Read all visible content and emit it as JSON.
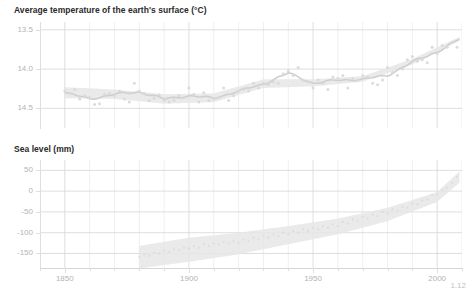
{
  "corner": {
    "mark": "·"
  },
  "footnote": {
    "text": "1.12"
  },
  "panels": {
    "temperature": {
      "title": "Average temperature of the earth's surface (°C)",
      "y_ticks": [
        "14.5",
        "14.0",
        "13.5"
      ]
    },
    "sealevel": {
      "title": "Sea level (mm)",
      "y_ticks": [
        "50",
        "0",
        "-50",
        "-100",
        "-150"
      ]
    }
  },
  "x_axis": {
    "labels": [
      "1850",
      "1900",
      "1950",
      "2000"
    ],
    "range": [
      1840,
      2010
    ],
    "major_step": 50,
    "minor_step": 10
  },
  "style": {
    "point_color": "#d9d9d9",
    "line_color": "#cfcfcf",
    "band_color": "#e6e6e6",
    "grid_color": "#e4e4e4",
    "axis_text_color": "#b4b4b4",
    "title_color": "#2a2a2a",
    "background": "#ffffff"
  },
  "chart_data": [
    {
      "type": "scatter",
      "id": "temperature",
      "title": "Average temperature of the earth's surface (°C)",
      "xlabel": "",
      "ylabel": "Average temperature of the earth's surface (°C)",
      "xlim": [
        1840,
        2010
      ],
      "ylim": [
        13.25,
        14.6
      ],
      "yticks": [
        13.5,
        14.0,
        14.5
      ],
      "xticks": [
        1850,
        1900,
        1950,
        2000
      ],
      "grid": true,
      "legend": "none",
      "series": [
        {
          "name": "Annual mean temperature (observations)",
          "kind": "scatter",
          "x": [
            1850,
            1852,
            1854,
            1856,
            1858,
            1860,
            1862,
            1864,
            1866,
            1868,
            1870,
            1872,
            1874,
            1876,
            1878,
            1880,
            1882,
            1884,
            1886,
            1888,
            1890,
            1892,
            1894,
            1896,
            1898,
            1900,
            1902,
            1904,
            1906,
            1908,
            1910,
            1912,
            1914,
            1916,
            1918,
            1920,
            1922,
            1924,
            1926,
            1928,
            1930,
            1932,
            1934,
            1936,
            1938,
            1940,
            1942,
            1944,
            1946,
            1948,
            1950,
            1952,
            1954,
            1956,
            1958,
            1960,
            1962,
            1964,
            1966,
            1968,
            1970,
            1972,
            1974,
            1976,
            1978,
            1980,
            1982,
            1984,
            1986,
            1988,
            1990,
            1992,
            1994,
            1996,
            1998,
            2000,
            2002,
            2004,
            2006,
            2008
          ],
          "y": [
            13.72,
            13.69,
            13.74,
            13.62,
            13.66,
            13.64,
            13.55,
            13.56,
            13.68,
            13.69,
            13.66,
            13.72,
            13.62,
            13.58,
            13.82,
            13.72,
            13.69,
            13.6,
            13.63,
            13.67,
            13.6,
            13.58,
            13.6,
            13.66,
            13.64,
            13.76,
            13.68,
            13.58,
            13.7,
            13.6,
            13.62,
            13.64,
            13.76,
            13.6,
            13.66,
            13.72,
            13.74,
            13.72,
            13.82,
            13.76,
            13.82,
            13.8,
            13.84,
            13.82,
            13.94,
            13.98,
            13.92,
            14.02,
            13.86,
            13.84,
            13.76,
            13.86,
            13.82,
            13.74,
            13.9,
            13.88,
            13.92,
            13.76,
            13.88,
            13.86,
            13.92,
            13.9,
            13.82,
            13.8,
            13.86,
            14.02,
            13.96,
            13.92,
            14.0,
            14.12,
            14.16,
            14.1,
            14.12,
            14.08,
            14.28,
            14.2,
            14.3,
            14.28,
            14.34,
            14.28
          ]
        },
        {
          "name": "Smoothed trend",
          "kind": "line",
          "x": [
            1850,
            1860,
            1870,
            1880,
            1890,
            1900,
            1910,
            1920,
            1930,
            1940,
            1950,
            1960,
            1970,
            1980,
            1990,
            2000,
            2009
          ],
          "y": [
            13.7,
            13.62,
            13.68,
            13.71,
            13.62,
            13.66,
            13.63,
            13.72,
            13.81,
            13.95,
            13.82,
            13.86,
            13.87,
            13.92,
            14.09,
            14.22,
            14.38
          ]
        },
        {
          "name": "Uncertainty band",
          "kind": "band",
          "x": [
            1850,
            1870,
            1890,
            1910,
            1930,
            1950,
            1970,
            1990,
            2009
          ],
          "y_low": [
            13.63,
            13.62,
            13.56,
            13.58,
            13.76,
            13.78,
            13.84,
            14.06,
            14.36
          ],
          "y_high": [
            13.77,
            13.74,
            13.68,
            13.69,
            13.87,
            13.87,
            13.91,
            14.13,
            14.41
          ]
        }
      ]
    },
    {
      "type": "scatter",
      "id": "sealevel",
      "title": "Sea level (mm)",
      "xlabel": "",
      "ylabel": "Sea level (mm)",
      "xlim": [
        1840,
        2010
      ],
      "ylim": [
        -185,
        75
      ],
      "yticks": [
        50,
        0,
        -50,
        -100,
        -150
      ],
      "xticks": [
        1850,
        1900,
        1950,
        2000
      ],
      "grid": true,
      "legend": "none",
      "series": [
        {
          "name": "Sea level (observations)",
          "kind": "scatter",
          "x": [
            1880,
            1882,
            1884,
            1886,
            1888,
            1890,
            1892,
            1894,
            1896,
            1898,
            1900,
            1902,
            1904,
            1906,
            1908,
            1910,
            1912,
            1914,
            1916,
            1918,
            1920,
            1922,
            1924,
            1926,
            1928,
            1930,
            1932,
            1934,
            1936,
            1938,
            1940,
            1942,
            1944,
            1946,
            1948,
            1950,
            1952,
            1954,
            1956,
            1958,
            1960,
            1962,
            1964,
            1966,
            1968,
            1970,
            1972,
            1974,
            1976,
            1978,
            1980,
            1982,
            1984,
            1986,
            1988,
            1990,
            1992,
            1994,
            1996,
            1998,
            2000,
            2002,
            2004,
            2006,
            2008
          ],
          "y": [
            -158,
            -152,
            -156,
            -148,
            -150,
            -143,
            -146,
            -140,
            -142,
            -136,
            -138,
            -132,
            -136,
            -128,
            -132,
            -126,
            -128,
            -122,
            -126,
            -120,
            -124,
            -116,
            -120,
            -112,
            -116,
            -108,
            -112,
            -104,
            -108,
            -100,
            -104,
            -96,
            -100,
            -92,
            -96,
            -88,
            -92,
            -84,
            -88,
            -80,
            -84,
            -74,
            -78,
            -68,
            -72,
            -62,
            -66,
            -56,
            -60,
            -50,
            -54,
            -44,
            -46,
            -38,
            -40,
            -30,
            -32,
            -22,
            -20,
            -10,
            -8,
            2,
            8,
            20,
            34
          ]
        },
        {
          "name": "Uncertainty band",
          "kind": "band",
          "x": [
            1880,
            1900,
            1920,
            1940,
            1960,
            1980,
            2000,
            2009
          ],
          "y_low": [
            -186,
            -170,
            -152,
            -128,
            -104,
            -72,
            -26,
            20
          ],
          "y_high": [
            -132,
            -112,
            -100,
            -84,
            -66,
            -40,
            -2,
            48
          ]
        }
      ]
    }
  ]
}
